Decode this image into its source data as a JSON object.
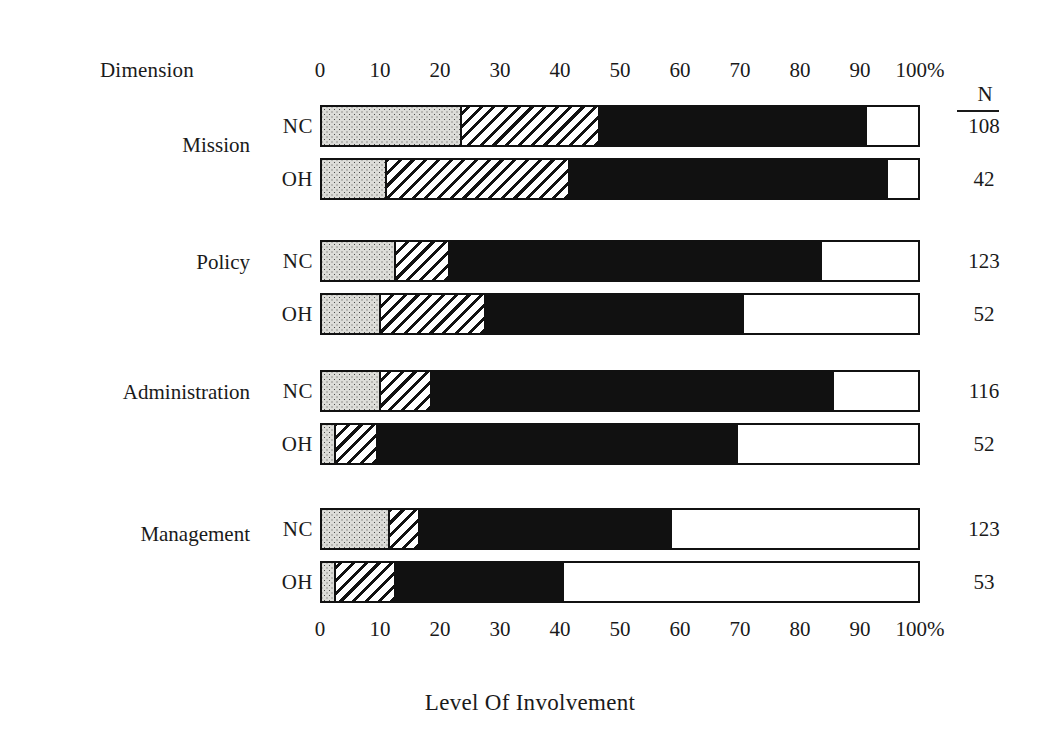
{
  "header": {
    "dimension_label": "Dimension",
    "n_label": "N"
  },
  "title": "Level Of Involvement",
  "chart_data": {
    "type": "bar",
    "orientation": "horizontal",
    "stacked": true,
    "normalized": "percent",
    "title": "Level Of Involvement",
    "xlabel": "Level Of Involvement",
    "ylabel": "Dimension",
    "xlim": [
      0,
      100
    ],
    "grid": false,
    "legend_position": "none",
    "axis_unit": "%",
    "tick_labels": [
      "0",
      "10",
      "20",
      "30",
      "40",
      "50",
      "60",
      "70",
      "80",
      "90",
      "100%"
    ],
    "tick_values": [
      0,
      10,
      20,
      30,
      40,
      50,
      60,
      70,
      80,
      90,
      100
    ],
    "segment_names": [
      "none",
      "low",
      "moderate",
      "high"
    ],
    "segment_styles": [
      "dotted",
      "hatched",
      "solid-black",
      "white"
    ],
    "n_column_header": "N",
    "groups": [
      {
        "label": "Mission",
        "rows": [
          {
            "label": "NC",
            "n": "108",
            "values": [
              23,
              23,
              44.5,
              9.5
            ],
            "cumulative": [
              23,
              46,
              90.5,
              100
            ]
          },
          {
            "label": "OH",
            "n": "42",
            "values": [
              10.5,
              30.5,
              53,
              6
            ],
            "cumulative": [
              10.5,
              41,
              94,
              100
            ]
          }
        ]
      },
      {
        "label": "Policy",
        "rows": [
          {
            "label": "NC",
            "n": "123",
            "values": [
              12,
              9,
              62,
              17
            ],
            "cumulative": [
              12,
              21,
              83,
              100
            ]
          },
          {
            "label": "OH",
            "n": "52",
            "values": [
              9.5,
              17.5,
              43,
              30
            ],
            "cumulative": [
              9.5,
              27,
              70,
              100
            ]
          }
        ]
      },
      {
        "label": "Administration",
        "rows": [
          {
            "label": "NC",
            "n": "116",
            "values": [
              9.5,
              8.5,
              67,
              15
            ],
            "cumulative": [
              9.5,
              18,
              85,
              100
            ]
          },
          {
            "label": "OH",
            "n": "52",
            "values": [
              2,
              7,
              60,
              31
            ],
            "cumulative": [
              2,
              9,
              69,
              100
            ]
          }
        ]
      },
      {
        "label": "Management",
        "rows": [
          {
            "label": "NC",
            "n": "123",
            "values": [
              11,
              5,
              42,
              42
            ],
            "cumulative": [
              11,
              16,
              58,
              100
            ]
          },
          {
            "label": "OH",
            "n": "53",
            "values": [
              2,
              10,
              28,
              60
            ],
            "cumulative": [
              2,
              12,
              40,
              100
            ]
          }
        ]
      }
    ]
  },
  "colors": {
    "ink": "#111111",
    "dotted_fill": "#dcdcd8",
    "solid_fill": "#111111",
    "background": "#ffffff"
  }
}
